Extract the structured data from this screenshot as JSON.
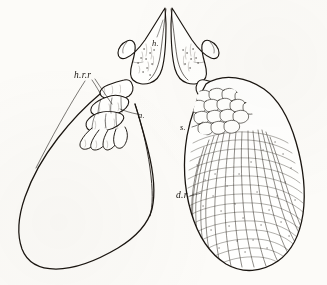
{
  "figure": {
    "background_color": "#fcfbf8",
    "ink_color": "#1a1510",
    "caption": ""
  },
  "labels": [
    {
      "id": "hrr",
      "text": "h.r.r",
      "target": "carpal and digital ray bones, left side"
    },
    {
      "id": "h",
      "text": "h.",
      "target": "humerus"
    },
    {
      "id": "a",
      "text": "a.",
      "target": "articulation of radials"
    },
    {
      "id": "s",
      "text": "s.",
      "target": "scales at fin base"
    },
    {
      "id": "dr",
      "text": "d.r",
      "target": "dermal fin rays"
    }
  ],
  "panels": {
    "left": {
      "name": "outline-fin-membrane",
      "rendering": "plain outline, unshaded"
    },
    "right": {
      "name": "scaled-fin-membrane",
      "rendering": "reticulated scale and ray texture"
    }
  }
}
